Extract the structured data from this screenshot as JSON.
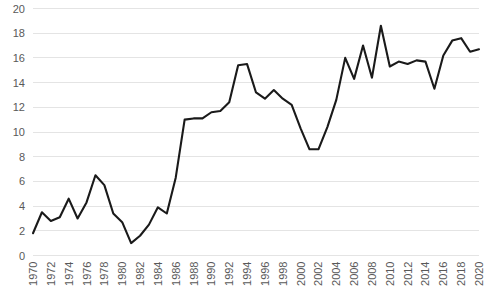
{
  "chart_data": {
    "type": "line",
    "title": "",
    "subtitle": "",
    "xlabel": "",
    "ylabel": "",
    "grid": "horizontal",
    "legend": "none",
    "xlim": [
      1970,
      2020
    ],
    "ylim": [
      0,
      20
    ],
    "ytick_step": 2,
    "xtick_step": 2,
    "yticks": [
      0,
      2,
      4,
      6,
      8,
      10,
      12,
      14,
      16,
      18,
      20
    ],
    "ytick_labels": [
      "0",
      "2",
      "4",
      "6",
      "8",
      "10",
      "12",
      "14",
      "16",
      "18",
      "20"
    ],
    "xticks": [
      1970,
      1972,
      1974,
      1976,
      1978,
      1980,
      1982,
      1984,
      1986,
      1988,
      1990,
      1992,
      1994,
      1996,
      1998,
      2000,
      2002,
      2004,
      2006,
      2008,
      2010,
      2012,
      2014,
      2016,
      2018,
      2020
    ],
    "xtick_labels": [
      "1970",
      "1972",
      "1974",
      "1976",
      "1978",
      "1980",
      "1982",
      "1984",
      "1986",
      "1988",
      "1990",
      "1992",
      "1994",
      "1996",
      "1998",
      "2000",
      "2002",
      "2004",
      "2006",
      "2008",
      "2010",
      "2012",
      "2014",
      "2016",
      "2018",
      "2020"
    ],
    "xtick_rotation": -90,
    "series": [
      {
        "name": "series-1",
        "color": "#1a1a1a",
        "x": [
          1970,
          1971,
          1972,
          1973,
          1974,
          1975,
          1976,
          1977,
          1978,
          1979,
          1980,
          1981,
          1982,
          1983,
          1984,
          1985,
          1986,
          1987,
          1988,
          1989,
          1990,
          1991,
          1992,
          1993,
          1994,
          1995,
          1996,
          1997,
          1998,
          1999,
          2000,
          2001,
          2002,
          2003,
          2004,
          2005,
          2006,
          2007,
          2008,
          2009,
          2010,
          2011,
          2012,
          2013,
          2014,
          2015,
          2016,
          2017,
          2018,
          2019,
          2020
        ],
        "values": [
          1.8,
          3.5,
          2.8,
          3.1,
          4.6,
          3.0,
          4.3,
          6.5,
          5.7,
          3.4,
          2.7,
          1.0,
          1.6,
          2.5,
          3.9,
          3.4,
          6.3,
          11.0,
          11.1,
          11.1,
          11.6,
          11.7,
          12.4,
          15.4,
          15.5,
          13.2,
          12.7,
          13.4,
          12.7,
          12.2,
          10.3,
          8.6,
          8.6,
          10.4,
          12.6,
          16.0,
          14.3,
          17.0,
          14.4,
          18.6,
          15.3,
          15.7,
          15.5,
          15.8,
          15.7,
          13.5,
          16.2,
          17.4,
          17.6,
          16.5,
          16.7
        ]
      }
    ]
  }
}
